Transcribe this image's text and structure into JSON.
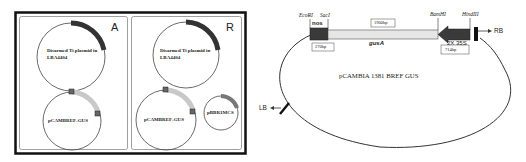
{
  "figure": {
    "left_panel": {
      "panel_a": {
        "letter": "A",
        "plasmids": [
          {
            "label_line1": "Disarmed Ti plasmid in",
            "label_line2": "LBA4404"
          },
          {
            "label_line1": "pCAMBREF-GUS",
            "label_line2": ""
          }
        ]
      },
      "panel_b": {
        "letter": "R",
        "plasmids": [
          {
            "label_line1": "Disarmed Ti plasmid in",
            "label_line2": "LBA4404"
          },
          {
            "label_line1": "pCAMBREF-GUS",
            "label_line2": ""
          },
          {
            "label_line1": "pBBR1MCS",
            "label_line2": ""
          }
        ]
      }
    },
    "right_panel": {
      "plasmid_name": "pCAMBIA 1381 BREF GUS",
      "sites": {
        "ecori": "EcoRI",
        "saci": "SacI",
        "bamhi": "BamHI",
        "hindiii": "HindIII"
      },
      "segments": {
        "nos": "nos",
        "nos_size": "270bp",
        "gusa": "gusA",
        "gusa_size": "1900bp",
        "promoter": "2X 35S",
        "promoter_size": "714bp"
      },
      "borders": {
        "rb": "RB",
        "lb": "LB"
      }
    },
    "colors": {
      "dark_segment": "#3a3a3a",
      "light_segment": "#e6e6e6",
      "medium_segment": "#777777",
      "line": "#333333"
    }
  }
}
